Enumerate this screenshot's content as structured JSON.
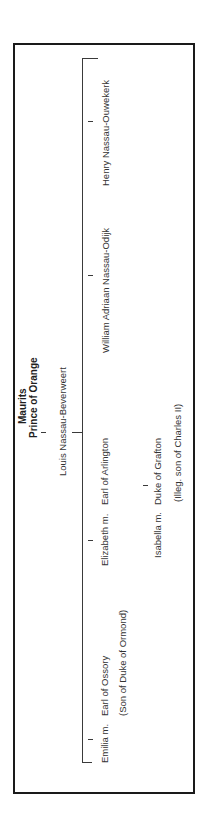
{
  "diagram": {
    "type": "family-tree",
    "orientation": "rotated-90-ccw",
    "root": {
      "name": "Maurits",
      "title": "Prince of Orange"
    },
    "child": {
      "name": "Louis Nassau-Beverweert"
    },
    "grandchildren": [
      {
        "name": "Henry Nassau-Ouwekerk"
      },
      {
        "name": "William Adriaan Nassau-Odijk"
      },
      {
        "name": "Elizabeth m.",
        "spouse": "Earl of Arlington"
      },
      {
        "name": "Emilia m.",
        "spouse": "Earl of Ossory",
        "spouse_note": "(Son of Duke of Ormond)"
      }
    ],
    "great_grandchild": {
      "name": "Isabella m.",
      "spouse": "Duke of Grafton",
      "spouse_note": "(Illeg. son of Charles II)"
    }
  },
  "colors": {
    "border": "#1a1a1a",
    "line": "#3a3a3a",
    "text": "#333333"
  }
}
